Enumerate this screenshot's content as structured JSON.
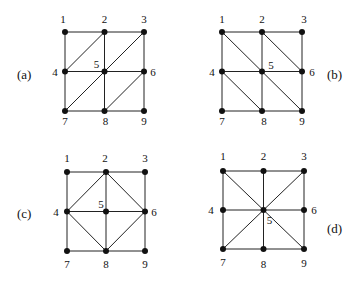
{
  "diagrams": [
    {
      "id": "a",
      "caption": "(a)",
      "caption_pos": [
        17,
        79
      ],
      "origin": [
        65,
        32
      ],
      "step": [
        39.5,
        39.5
      ],
      "edges": [
        [
          1,
          2
        ],
        [
          2,
          3
        ],
        [
          4,
          5
        ],
        [
          5,
          6
        ],
        [
          7,
          8
        ],
        [
          8,
          9
        ],
        [
          1,
          4
        ],
        [
          4,
          7
        ],
        [
          2,
          5
        ],
        [
          5,
          8
        ],
        [
          3,
          6
        ],
        [
          6,
          9
        ],
        [
          2,
          4
        ],
        [
          3,
          5
        ],
        [
          5,
          7
        ],
        [
          6,
          8
        ]
      ],
      "label_offsets": {
        "1": [
          -2,
          -9
        ],
        "2": [
          0,
          -9
        ],
        "3": [
          0,
          -9
        ],
        "4": [
          -10,
          4
        ],
        "5": [
          -8,
          -4
        ],
        "6": [
          9,
          4
        ],
        "7": [
          0,
          14
        ],
        "8": [
          1,
          14
        ],
        "9": [
          0,
          14
        ]
      }
    },
    {
      "id": "b",
      "caption": "(b)",
      "caption_pos": [
        327,
        79
      ],
      "origin": [
        222,
        32
      ],
      "step": [
        40,
        39.5
      ],
      "edges": [
        [
          1,
          2
        ],
        [
          2,
          3
        ],
        [
          4,
          5
        ],
        [
          5,
          6
        ],
        [
          7,
          8
        ],
        [
          8,
          9
        ],
        [
          1,
          4
        ],
        [
          4,
          7
        ],
        [
          2,
          5
        ],
        [
          5,
          8
        ],
        [
          3,
          6
        ],
        [
          6,
          9
        ],
        [
          1,
          5
        ],
        [
          5,
          9
        ],
        [
          2,
          6
        ],
        [
          4,
          8
        ]
      ],
      "label_offsets": {
        "1": [
          0,
          -9
        ],
        "2": [
          0,
          -9
        ],
        "3": [
          2,
          -9
        ],
        "4": [
          -10,
          4
        ],
        "5": [
          9,
          -3
        ],
        "6": [
          10,
          4
        ],
        "7": [
          0,
          14
        ],
        "8": [
          2,
          14
        ],
        "9": [
          0,
          14
        ]
      }
    },
    {
      "id": "c",
      "caption": "(c)",
      "caption_pos": [
        17,
        218
      ],
      "origin": [
        67,
        172
      ],
      "step": [
        39,
        39.5
      ],
      "edges": [
        [
          1,
          2
        ],
        [
          2,
          3
        ],
        [
          4,
          5
        ],
        [
          5,
          6
        ],
        [
          7,
          8
        ],
        [
          8,
          9
        ],
        [
          1,
          4
        ],
        [
          4,
          7
        ],
        [
          2,
          5
        ],
        [
          5,
          8
        ],
        [
          3,
          6
        ],
        [
          6,
          9
        ],
        [
          2,
          4
        ],
        [
          2,
          6
        ],
        [
          4,
          8
        ],
        [
          6,
          8
        ]
      ],
      "label_offsets": {
        "1": [
          0,
          -10
        ],
        "2": [
          -1,
          -10
        ],
        "3": [
          0,
          -10
        ],
        "4": [
          -11,
          4
        ],
        "5": [
          -5,
          -4
        ],
        "6": [
          9,
          4
        ],
        "7": [
          0,
          17
        ],
        "8": [
          0,
          17
        ],
        "9": [
          0,
          17
        ]
      }
    },
    {
      "id": "d",
      "caption": "(d)",
      "caption_pos": [
        327,
        233
      ],
      "origin": [
        223,
        171
      ],
      "step": [
        40.5,
        39
      ],
      "edges": [
        [
          1,
          2
        ],
        [
          2,
          3
        ],
        [
          4,
          5
        ],
        [
          5,
          6
        ],
        [
          7,
          8
        ],
        [
          8,
          9
        ],
        [
          1,
          4
        ],
        [
          4,
          7
        ],
        [
          2,
          5
        ],
        [
          5,
          8
        ],
        [
          3,
          6
        ],
        [
          6,
          9
        ],
        [
          1,
          5
        ],
        [
          5,
          9
        ],
        [
          3,
          5
        ],
        [
          5,
          7
        ]
      ],
      "label_offsets": {
        "1": [
          0,
          -11
        ],
        "2": [
          0,
          -11
        ],
        "3": [
          0,
          -11
        ],
        "4": [
          -12,
          4
        ],
        "5": [
          6,
          14
        ],
        "6": [
          10,
          4
        ],
        "7": [
          0,
          17
        ],
        "8": [
          0,
          19
        ],
        "9": [
          0,
          18
        ]
      }
    }
  ],
  "node_labels": [
    "1",
    "2",
    "3",
    "4",
    "5",
    "6",
    "7",
    "8",
    "9"
  ]
}
